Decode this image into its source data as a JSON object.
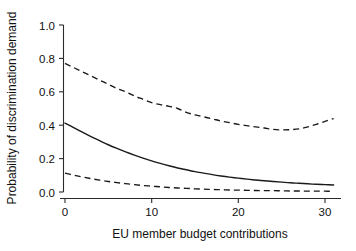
{
  "figure": {
    "background_color": "#ffffff",
    "line_color": "#1a1a1a"
  },
  "chart_data": {
    "type": "line",
    "title": "",
    "xlabel": "EU member budget contributions",
    "ylabel": "Probability of discrimination demand",
    "xlim": [
      -0.6,
      31.8
    ],
    "ylim": [
      0.0,
      1.0
    ],
    "xticks": [
      0,
      10,
      20,
      30
    ],
    "xticklabels": [
      "0",
      "10",
      "20",
      "30"
    ],
    "yticks": [
      0.0,
      0.2,
      0.4,
      0.6,
      0.8,
      1.0
    ],
    "yticklabels": [
      "0.0",
      "0.2",
      "0.4",
      "0.6",
      "0.8",
      "1.0"
    ],
    "grid": false,
    "legend": null,
    "x": [
      0,
      1,
      2,
      3,
      4,
      5,
      6,
      7,
      8,
      9,
      10,
      11,
      12,
      13,
      14,
      15,
      16,
      17,
      18,
      19,
      20,
      21,
      22,
      23,
      24,
      25,
      26,
      27,
      28,
      29,
      30,
      31
    ],
    "series": [
      {
        "name": "Upper 95% confidence bound",
        "style": "dashed",
        "values": [
          0.77,
          0.745,
          0.72,
          0.695,
          0.67,
          0.645,
          0.62,
          0.6,
          0.575,
          0.555,
          0.535,
          0.523,
          0.513,
          0.5,
          0.477,
          0.462,
          0.45,
          0.438,
          0.425,
          0.415,
          0.405,
          0.397,
          0.39,
          0.383,
          0.375,
          0.372,
          0.373,
          0.378,
          0.39,
          0.405,
          0.423,
          0.44
        ]
      },
      {
        "name": "Predicted probability",
        "style": "solid",
        "values": [
          0.413,
          0.385,
          0.358,
          0.332,
          0.307,
          0.283,
          0.261,
          0.24,
          0.221,
          0.203,
          0.186,
          0.171,
          0.157,
          0.144,
          0.133,
          0.122,
          0.113,
          0.104,
          0.096,
          0.089,
          0.083,
          0.077,
          0.072,
          0.067,
          0.063,
          0.059,
          0.055,
          0.052,
          0.049,
          0.046,
          0.044,
          0.042
        ]
      },
      {
        "name": "Lower 95% confidence bound",
        "style": "dashed",
        "values": [
          0.113,
          0.101,
          0.09,
          0.08,
          0.071,
          0.063,
          0.056,
          0.05,
          0.044,
          0.039,
          0.035,
          0.031,
          0.027,
          0.024,
          0.022,
          0.019,
          0.017,
          0.015,
          0.014,
          0.012,
          0.011,
          0.01,
          0.009,
          0.008,
          0.008,
          0.007,
          0.006,
          0.006,
          0.005,
          0.005,
          0.005,
          0.004
        ]
      }
    ]
  }
}
